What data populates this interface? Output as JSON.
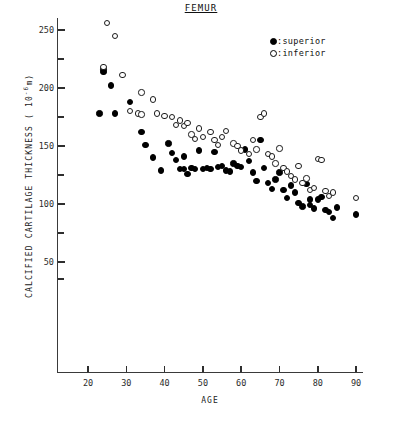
{
  "chart_data": {
    "type": "scatter",
    "title": "FEMUR",
    "xlabel": "AGE",
    "ylabel": "CALCIFIED CARTILAGE THICKNESS ( 10",
    "ylabel_exponent": "-6",
    "ylabel_unit": "m)",
    "xlim": [
      15,
      95
    ],
    "ylim": [
      30,
      265
    ],
    "xticks": [
      20,
      30,
      40,
      50,
      60,
      70,
      80,
      90
    ],
    "yticks": [
      50,
      100,
      150,
      200,
      250
    ],
    "yticks_minor": [
      75,
      125,
      175,
      225
    ],
    "grid": false,
    "legend_position": "top-right",
    "series": [
      {
        "name": "superior",
        "marker": "filled-circle",
        "color": "#000000",
        "legend_label": ":superior",
        "points": [
          [
            24,
            216
          ],
          [
            24,
            214
          ],
          [
            23,
            178
          ],
          [
            26,
            202
          ],
          [
            27,
            178
          ],
          [
            31,
            188
          ],
          [
            34,
            162
          ],
          [
            35,
            151
          ],
          [
            37,
            140
          ],
          [
            39,
            129
          ],
          [
            41,
            152
          ],
          [
            42,
            144
          ],
          [
            43,
            138
          ],
          [
            44,
            130
          ],
          [
            45,
            141
          ],
          [
            45,
            130
          ],
          [
            46,
            126
          ],
          [
            47,
            131
          ],
          [
            48,
            130
          ],
          [
            49,
            146
          ],
          [
            50,
            130
          ],
          [
            51,
            131
          ],
          [
            52,
            130
          ],
          [
            53,
            145
          ],
          [
            54,
            132
          ],
          [
            55,
            133
          ],
          [
            56,
            129
          ],
          [
            57,
            128
          ],
          [
            58,
            135
          ],
          [
            59,
            133
          ],
          [
            60,
            132
          ],
          [
            61,
            147
          ],
          [
            62,
            137
          ],
          [
            63,
            127
          ],
          [
            64,
            120
          ],
          [
            65,
            155
          ],
          [
            66,
            131
          ],
          [
            67,
            118
          ],
          [
            68,
            113
          ],
          [
            69,
            121
          ],
          [
            70,
            127
          ],
          [
            71,
            112
          ],
          [
            72,
            105
          ],
          [
            73,
            116
          ],
          [
            74,
            110
          ],
          [
            75,
            101
          ],
          [
            76,
            98
          ],
          [
            77,
            117
          ],
          [
            78,
            104
          ],
          [
            78,
            99
          ],
          [
            79,
            96
          ],
          [
            80,
            104
          ],
          [
            81,
            106
          ],
          [
            82,
            95
          ],
          [
            83,
            93
          ],
          [
            84,
            88
          ],
          [
            85,
            97
          ],
          [
            90,
            91
          ]
        ]
      },
      {
        "name": "inferior",
        "marker": "open-circle",
        "color": "#ffffff",
        "legend_label": ":inferior",
        "points": [
          [
            25,
            256
          ],
          [
            27,
            245
          ],
          [
            24,
            218
          ],
          [
            29,
            211
          ],
          [
            31,
            180
          ],
          [
            33,
            178
          ],
          [
            34,
            196
          ],
          [
            34,
            177
          ],
          [
            37,
            190
          ],
          [
            38,
            178
          ],
          [
            40,
            176
          ],
          [
            42,
            175
          ],
          [
            43,
            168
          ],
          [
            44,
            172
          ],
          [
            45,
            167
          ],
          [
            46,
            170
          ],
          [
            47,
            160
          ],
          [
            48,
            156
          ],
          [
            49,
            165
          ],
          [
            50,
            158
          ],
          [
            52,
            162
          ],
          [
            53,
            155
          ],
          [
            54,
            151
          ],
          [
            55,
            158
          ],
          [
            56,
            163
          ],
          [
            58,
            152
          ],
          [
            59,
            150
          ],
          [
            60,
            146
          ],
          [
            62,
            143
          ],
          [
            63,
            155
          ],
          [
            64,
            147
          ],
          [
            65,
            175
          ],
          [
            66,
            178
          ],
          [
            67,
            143
          ],
          [
            68,
            141
          ],
          [
            69,
            135
          ],
          [
            70,
            148
          ],
          [
            71,
            131
          ],
          [
            72,
            128
          ],
          [
            73,
            124
          ],
          [
            74,
            121
          ],
          [
            75,
            133
          ],
          [
            76,
            118
          ],
          [
            77,
            122
          ],
          [
            78,
            112
          ],
          [
            79,
            114
          ],
          [
            80,
            139
          ],
          [
            81,
            138
          ],
          [
            82,
            111
          ],
          [
            83,
            107
          ],
          [
            84,
            110
          ],
          [
            90,
            105
          ]
        ]
      }
    ]
  },
  "axes": {
    "y_axis_name": "y-axis",
    "x_axis_name": "x-axis"
  }
}
